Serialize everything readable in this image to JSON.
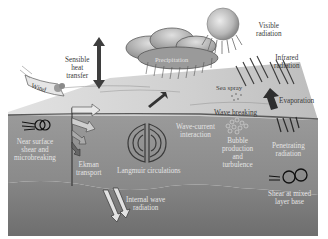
{
  "diagram": {
    "title": "",
    "colors": {
      "background": "#ffffff",
      "sea_surface": "#c9c9c9",
      "mixed_layer": "#8a8a8a",
      "deep_layer": "#7a7a7a",
      "text_on_water": "#e4e4e4",
      "text_on_sky": "#3a3a3a",
      "sun": "#bdbdbd"
    },
    "labels": {
      "sensible_heat": "Sensible\nheat\ntransfer",
      "precipitation": "Precipitation",
      "visible_radiation": "Visible\nradiation",
      "infrared_radiation": "Infrared\nradiation",
      "wind": "Wind",
      "sea_spray": "Sea spray",
      "evaporation": "Evaporation",
      "wave_breaking": "Wave breaking",
      "near_surface_shear": "Near surface\nshear and\nmicrobreaking",
      "ekman_transport": "Ekman\ntransport",
      "wave_current_interaction": "Wave-current\ninteraction",
      "bubble_production": "Bubble\nproduction\nand\nturbulence",
      "penetrating_radiation": "Penetrating\nradiation",
      "langmuir_circulations": "Langmuir circulations",
      "internal_wave_radiation": "Internal wave\nradiation",
      "shear_mixed_layer_base": "Shear at mixed\nlayer base"
    }
  }
}
